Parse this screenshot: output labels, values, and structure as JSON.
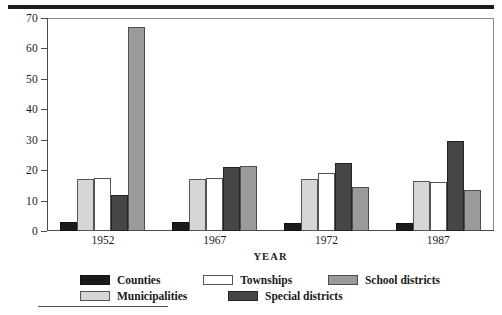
{
  "chart_data": {
    "type": "bar",
    "title": "",
    "xlabel": "YEAR",
    "ylabel": "",
    "categories": [
      "1952",
      "1967",
      "1972",
      "1987"
    ],
    "ylim": [
      0,
      70
    ],
    "yticks": [
      0,
      10,
      20,
      30,
      40,
      50,
      60,
      70
    ],
    "grid": false,
    "legend_position": "bottom",
    "series": [
      {
        "name": "Counties",
        "color": "#1b1b1b",
        "values": [
          3,
          3,
          2.5,
          2.5
        ]
      },
      {
        "name": "Municipalities",
        "color": "#d6d6d4",
        "values": [
          17,
          17,
          17,
          16.5
        ]
      },
      {
        "name": "Townships",
        "color": "#ffffff",
        "values": [
          17.5,
          17.5,
          19,
          16
        ]
      },
      {
        "name": "Special districts",
        "color": "#464646",
        "values": [
          12,
          21,
          22.5,
          29.5
        ]
      },
      {
        "name": "School districts",
        "color": "#9a9a99",
        "values": [
          67,
          21.5,
          14.5,
          13.5
        ]
      }
    ]
  },
  "axis": {
    "y_tick_labels": [
      "0",
      "10",
      "20",
      "30",
      "40",
      "50",
      "60",
      "70"
    ],
    "x_tick_labels": [
      "1952",
      "1967",
      "1972",
      "1987"
    ],
    "x_title": "YEAR"
  },
  "legend": {
    "items": [
      {
        "label": "Counties",
        "swatch": "black-swatch"
      },
      {
        "label": "Townships",
        "swatch": "white-swatch"
      },
      {
        "label": "School districts",
        "swatch": "medium-gray-swatch"
      },
      {
        "label": "Municipalities",
        "swatch": "light-gray-swatch"
      },
      {
        "label": "Special districts",
        "swatch": "dark-gray-swatch"
      }
    ]
  }
}
